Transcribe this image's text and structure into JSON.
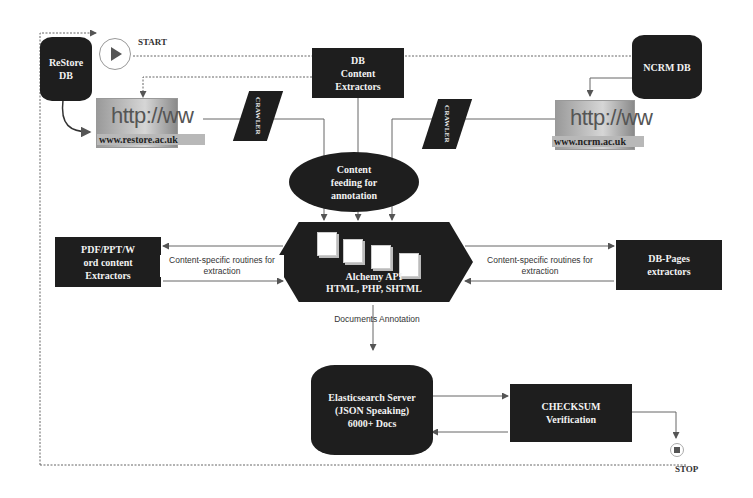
{
  "diagram": {
    "type": "flowchart",
    "colors": {
      "node_fill": "#1e1e1e",
      "node_text": "#f2f2f2",
      "line": "#555555",
      "background": "#ffffff"
    },
    "controls": {
      "start": {
        "label": "START",
        "icon": "play-icon"
      },
      "stop": {
        "label": "STOP",
        "icon": "stop-icon"
      }
    },
    "nodes": {
      "restore_db": {
        "line1": "ReStore",
        "line2": "DB",
        "shape": "cylinder"
      },
      "ncrm_db": {
        "label": "NCRM DB",
        "shape": "cylinder"
      },
      "db_content_extractors": {
        "line1": "DB",
        "line2": "Content",
        "line3": "Extractors",
        "shape": "rectangle"
      },
      "restore_site": {
        "big": "http://ww",
        "url": "www.restore.ac.uk",
        "shape": "web-image"
      },
      "ncrm_site": {
        "big": "http://ww",
        "url": "www.ncrm.ac.uk",
        "shape": "web-image"
      },
      "crawler_left": {
        "label": "CRAWLER",
        "shape": "parallelogram"
      },
      "crawler_right": {
        "label": "CRAWLER",
        "shape": "parallelogram"
      },
      "content_feeding": {
        "line1": "Content",
        "line2": "feeding for",
        "line3": "annotation",
        "shape": "ellipse"
      },
      "alchemy": {
        "line1": "Alchemy API",
        "line2": "HTML, PHP, SHTML",
        "shape": "hexagon"
      },
      "pdf_extractors": {
        "line1": "PDF/PPT/W",
        "line2": "ord content",
        "line3": "Extractors",
        "shape": "rectangle"
      },
      "db_pages_extractors": {
        "line1": "DB-Pages",
        "line2": "extractors",
        "shape": "rectangle"
      },
      "elasticsearch": {
        "line1": "Elasticsearch Server",
        "line2": "(JSON Speaking)",
        "line3": "6000+ Docs",
        "shape": "cylinder"
      },
      "checksum": {
        "line1": "CHECKSUM",
        "line2": "Verification",
        "shape": "rectangle"
      }
    },
    "edge_labels": {
      "left_routines": {
        "line1": "Content-specific routines for",
        "line2": "extraction"
      },
      "right_routines": {
        "line1": "Content-specific routines for",
        "line2": "extraction"
      },
      "documents_annotation": "Documents Annotation"
    }
  }
}
